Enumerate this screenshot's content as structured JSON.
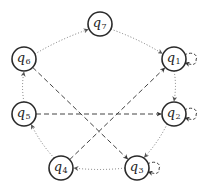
{
  "diagram": {
    "type": "state-transition-graph",
    "node_radius": 12,
    "states": [
      {
        "id": "q1",
        "base": "q",
        "sub": "1",
        "x": 174,
        "y": 59
      },
      {
        "id": "q2",
        "base": "q",
        "sub": "2",
        "x": 174,
        "y": 114
      },
      {
        "id": "q3",
        "base": "q",
        "sub": "3",
        "x": 137,
        "y": 168
      },
      {
        "id": "q4",
        "base": "q",
        "sub": "4",
        "x": 61,
        "y": 168
      },
      {
        "id": "q5",
        "base": "q",
        "sub": "5",
        "x": 24,
        "y": 114
      },
      {
        "id": "q6",
        "base": "q",
        "sub": "6",
        "x": 24,
        "y": 59
      },
      {
        "id": "q7",
        "base": "q",
        "sub": "7",
        "x": 100,
        "y": 24
      }
    ],
    "transitions": [
      {
        "from": "q6",
        "to": "q7",
        "style": "dotted"
      },
      {
        "from": "q7",
        "to": "q1",
        "style": "dotted"
      },
      {
        "from": "q1",
        "to": "q2",
        "style": "dotted"
      },
      {
        "from": "q2",
        "to": "q3",
        "style": "dotted"
      },
      {
        "from": "q3",
        "to": "q4",
        "style": "dotted"
      },
      {
        "from": "q4",
        "to": "q5",
        "style": "dotted"
      },
      {
        "from": "q5",
        "to": "q6",
        "style": "dotted"
      },
      {
        "from": "q6",
        "to": "q3",
        "style": "dashed"
      },
      {
        "from": "q5",
        "to": "q2",
        "style": "dashed"
      },
      {
        "from": "q4",
        "to": "q1",
        "style": "dashed"
      },
      {
        "from": "q1",
        "to": "q1",
        "style": "dashed-loop"
      },
      {
        "from": "q2",
        "to": "q2",
        "style": "dashed-loop"
      },
      {
        "from": "q3",
        "to": "q3",
        "style": "dashed-loop"
      }
    ],
    "colors": {
      "node_stroke": "#2a2a2a",
      "dotted_edge": "#777777",
      "dashed_edge": "#444444",
      "background": "#ffffff"
    }
  }
}
